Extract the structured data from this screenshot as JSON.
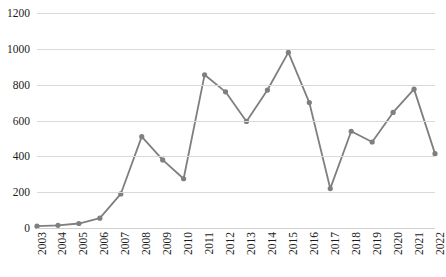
{
  "chart_data": {
    "type": "line",
    "title": "",
    "xlabel": "",
    "ylabel": "",
    "ylim": [
      0,
      1200
    ],
    "ytick_step": 200,
    "grid": true,
    "legend": "none",
    "line_color": "#7f7f7f",
    "marker_color": "#7f7f7f",
    "marker": "circle",
    "categories": [
      "2003",
      "2004",
      "2005",
      "2006",
      "2007",
      "2008",
      "2009",
      "2010",
      "2011",
      "2012",
      "2013",
      "2014",
      "2015",
      "2016",
      "2017",
      "2018",
      "2019",
      "2020",
      "2021",
      "2022"
    ],
    "values": [
      10,
      15,
      25,
      55,
      190,
      510,
      380,
      275,
      855,
      760,
      595,
      770,
      980,
      700,
      220,
      540,
      480,
      645,
      775,
      415
    ],
    "ytick_labels": [
      "0",
      "200",
      "400",
      "600",
      "800",
      "1000",
      "1200"
    ],
    "ytick_values": [
      0,
      200,
      400,
      600,
      800,
      1000,
      1200
    ]
  }
}
